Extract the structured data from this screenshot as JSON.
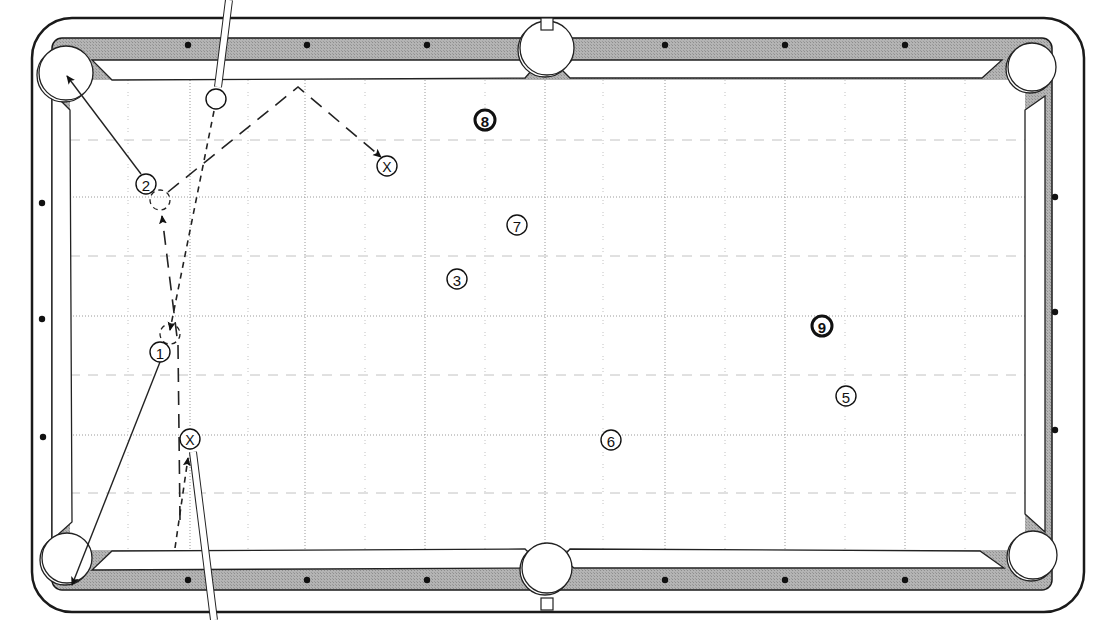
{
  "diagram": {
    "colors": {
      "rail": "#a9a9a9",
      "rail_outline": "#1a1a1a",
      "cushion": "#ffffff",
      "cloth": "#ffffff",
      "grid": "#9a9a9a",
      "diamond": "#111111",
      "pocket": "#ffffff",
      "line": "#222222"
    },
    "table": {
      "outer": {
        "x": 32,
        "y": 18,
        "w": 1052,
        "h": 594,
        "r": 40
      },
      "cloth": {
        "x": 70,
        "y": 80,
        "w": 955,
        "h": 470
      },
      "rail_inner": {
        "x": 52,
        "y": 38,
        "w": 1000,
        "h": 552
      }
    },
    "pockets": [
      {
        "id": "top-left",
        "cx": 66,
        "cy": 73,
        "r": 27
      },
      {
        "id": "top-center",
        "cx": 547,
        "cy": 48,
        "r": 27
      },
      {
        "id": "top-right",
        "cx": 1032,
        "cy": 67,
        "r": 24
      },
      {
        "id": "bottom-left",
        "cx": 67,
        "cy": 558,
        "r": 25
      },
      {
        "id": "bottom-center",
        "cx": 547,
        "cy": 568,
        "r": 25
      },
      {
        "id": "bottom-right",
        "cx": 1033,
        "cy": 555,
        "r": 24
      }
    ],
    "diamonds": [
      {
        "cx": 188,
        "cy": 45
      },
      {
        "cx": 307,
        "cy": 45
      },
      {
        "cx": 427,
        "cy": 45
      },
      {
        "cx": 665,
        "cy": 45
      },
      {
        "cx": 785,
        "cy": 45
      },
      {
        "cx": 905,
        "cy": 45
      },
      {
        "cx": 188,
        "cy": 580
      },
      {
        "cx": 307,
        "cy": 580
      },
      {
        "cx": 427,
        "cy": 580
      },
      {
        "cx": 665,
        "cy": 580
      },
      {
        "cx": 785,
        "cy": 580
      },
      {
        "cx": 905,
        "cy": 580
      },
      {
        "cx": 42,
        "cy": 203
      },
      {
        "cx": 42,
        "cy": 319
      },
      {
        "cx": 43,
        "cy": 437
      },
      {
        "cx": 1055,
        "cy": 197
      },
      {
        "cx": 1055,
        "cy": 312
      },
      {
        "cx": 1055,
        "cy": 430
      }
    ],
    "grid": {
      "major_x": [
        190,
        305,
        425,
        545,
        665,
        785,
        905
      ],
      "minor_x": [
        128,
        248,
        365,
        485,
        603,
        725,
        845,
        965
      ],
      "major_y": [
        197,
        316,
        435
      ],
      "minor_y": [
        140,
        256,
        375,
        493
      ]
    },
    "balls": [
      {
        "id": "1",
        "label": "1",
        "cx": 160,
        "cy": 352,
        "r": 10,
        "style": "plain"
      },
      {
        "id": "2",
        "label": "2",
        "cx": 146,
        "cy": 184,
        "r": 10,
        "style": "plain"
      },
      {
        "id": "3",
        "label": "3",
        "cx": 457,
        "cy": 279,
        "r": 10,
        "style": "plain"
      },
      {
        "id": "5",
        "label": "5",
        "cx": 846,
        "cy": 396,
        "r": 10,
        "style": "plain"
      },
      {
        "id": "6",
        "label": "6",
        "cx": 611,
        "cy": 440,
        "r": 10,
        "style": "plain"
      },
      {
        "id": "7",
        "label": "7",
        "cx": 517,
        "cy": 225,
        "r": 10,
        "style": "plain"
      },
      {
        "id": "8",
        "label": "8",
        "cx": 485,
        "cy": 120,
        "r": 10,
        "style": "bold"
      },
      {
        "id": "9",
        "label": "9",
        "cx": 822,
        "cy": 326,
        "r": 10,
        "style": "bold"
      }
    ],
    "cue_ball_positions": [
      {
        "id": "cue-start",
        "label": "",
        "cx": 216,
        "cy": 99,
        "r": 10,
        "style": "cue"
      },
      {
        "id": "position-x-top",
        "label": "X",
        "cx": 387,
        "cy": 166,
        "r": 10,
        "style": "target"
      },
      {
        "id": "position-x-bottom",
        "label": "X",
        "cx": 190,
        "cy": 439,
        "r": 10,
        "style": "target"
      }
    ],
    "ghost_balls": [
      {
        "id": "ghost-2",
        "cx": 160,
        "cy": 200,
        "r": 10
      },
      {
        "id": "ghost-1",
        "cx": 170,
        "cy": 334,
        "r": 10
      }
    ],
    "cue_sticks": [
      {
        "id": "cue-stick-top",
        "x1": 229,
        "y1": 0,
        "x2": 218,
        "y2": 87,
        "w": 6
      },
      {
        "id": "cue-stick-bottom",
        "x1": 193,
        "y1": 452,
        "x2": 214,
        "y2": 620,
        "w": 6
      }
    ],
    "object_paths": [
      {
        "id": "ball-1-to-bottom-left",
        "points": [
          [
            160,
            362
          ],
          [
            72,
            585
          ]
        ],
        "arrow": true
      },
      {
        "id": "ball-2-to-top-left",
        "points": [
          [
            141,
            174
          ],
          [
            67,
            76
          ]
        ],
        "arrow": true
      }
    ],
    "cue_paths": [
      {
        "id": "cue-path-top-shot",
        "points": [
          [
            214,
            111
          ],
          [
            170,
            330
          ]
        ],
        "dash": "6,5",
        "arrow": true
      },
      {
        "id": "cue-path-top-bank",
        "points": [
          [
            168,
            192
          ],
          [
            298,
            87
          ],
          [
            381,
            157
          ]
        ],
        "dash": "14,9",
        "arrow": true
      },
      {
        "id": "cue-path-bottom-shot",
        "points": [
          [
            175,
            548
          ],
          [
            188,
            458
          ]
        ],
        "dash": "6,5",
        "arrow": true
      },
      {
        "id": "cue-path-bottom-to-ghost-2",
        "points": [
          [
            180,
            520
          ],
          [
            178,
            345
          ],
          [
            162,
            216
          ]
        ],
        "dash": "14,9",
        "arrow": true
      }
    ]
  }
}
